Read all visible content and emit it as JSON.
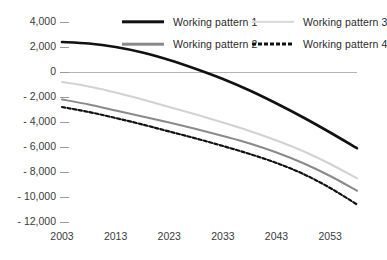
{
  "chart_data": {
    "type": "line",
    "title": "",
    "xlabel": "",
    "ylabel": "",
    "xlim": [
      2003,
      2058
    ],
    "ylim": [
      -12000,
      4000
    ],
    "grid": false,
    "legend_position": "top",
    "x_ticks": [
      "2003",
      "2013",
      "2023",
      "2033",
      "2043",
      "2053"
    ],
    "x_tick_values": [
      2003,
      2013,
      2023,
      2033,
      2043,
      2053
    ],
    "y_ticks": [
      "4,000",
      "2,000",
      "0",
      "- 2,000",
      "- 4,000",
      "- 6,000",
      "- 8,000",
      "- 10,000",
      "- 12,000"
    ],
    "y_tick_values": [
      4000,
      2000,
      0,
      -2000,
      -4000,
      -6000,
      -8000,
      -10000,
      -12000
    ],
    "x": [
      2003,
      2008,
      2013,
      2018,
      2023,
      2028,
      2033,
      2038,
      2043,
      2048,
      2053,
      2058
    ],
    "series": [
      {
        "name": "Working pattern 1",
        "color": "#111111",
        "style": "solid",
        "width": 2.6,
        "values": [
          2400,
          2280,
          2000,
          1560,
          960,
          240,
          -560,
          -1480,
          -2520,
          -3640,
          -4840,
          -6100
        ]
      },
      {
        "name": "Working pattern 2",
        "color": "#8a8a8a",
        "style": "solid",
        "width": 2.0,
        "values": [
          -2200,
          -2600,
          -3080,
          -3560,
          -4040,
          -4560,
          -5120,
          -5720,
          -6440,
          -7300,
          -8320,
          -9500
        ]
      },
      {
        "name": "Working pattern 3",
        "color": "#d2d2d2",
        "style": "solid",
        "width": 2.0,
        "values": [
          -800,
          -1160,
          -1640,
          -2200,
          -2800,
          -3400,
          -4040,
          -4720,
          -5480,
          -6340,
          -7360,
          -8500
        ]
      },
      {
        "name": "Working pattern 4",
        "color": "#111111",
        "style": "dashed",
        "width": 2.2,
        "values": [
          -2800,
          -3200,
          -3680,
          -4200,
          -4760,
          -5320,
          -5920,
          -6560,
          -7280,
          -8160,
          -9280,
          -10600
        ]
      }
    ]
  },
  "legend": {
    "items": [
      {
        "label": "Working pattern 1"
      },
      {
        "label": "Working pattern 2"
      },
      {
        "label": "Working pattern 3"
      },
      {
        "label": "Working pattern 4"
      }
    ]
  },
  "axes": {
    "y_labels": [
      "4,000",
      "2,000",
      "0",
      "- 2,000",
      "- 4,000",
      "- 6,000",
      "- 8,000",
      "- 10,000",
      "- 12,000"
    ],
    "x_labels": [
      "2003",
      "2013",
      "2023",
      "2033",
      "2043",
      "2053"
    ]
  }
}
